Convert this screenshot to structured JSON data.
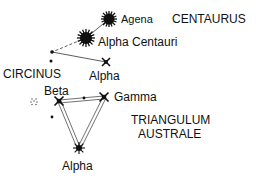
{
  "diagram": {
    "constellations": {
      "centaurus": {
        "label": "CENTAURUS",
        "x": 177,
        "y": 23
      },
      "circinus": {
        "label": "CIRCINUS",
        "x": 4,
        "y": 77
      },
      "triangulum_australe": {
        "label_line1": "TRIANGULUM",
        "label_line2": "AUSTRALE",
        "x": 135,
        "y": 126
      }
    },
    "stars": {
      "agena": {
        "label": "Agena",
        "x": 109,
        "y": 19,
        "lx": 121,
        "ly": 23
      },
      "alpha_centauri": {
        "label": "Alpha Centauri",
        "x": 86,
        "y": 38,
        "lx": 98,
        "ly": 46
      },
      "alpha_circini": {
        "label": "Alpha",
        "x": 106,
        "y": 62,
        "lx": 90,
        "ly": 78
      },
      "beta_tra": {
        "label": "Beta",
        "x": 59,
        "y": 101,
        "lx": 44,
        "ly": 96
      },
      "gamma_tra": {
        "label": "Gamma",
        "x": 104,
        "y": 97,
        "lx": 114,
        "ly": 101
      },
      "alpha_tra": {
        "label": "Alpha",
        "x": 79,
        "y": 148,
        "lx": 63,
        "ly": 166
      }
    },
    "colors": {
      "ink": "#111111",
      "background": "#ffffff"
    }
  }
}
